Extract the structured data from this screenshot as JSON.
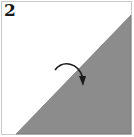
{
  "step": {
    "number": "2"
  },
  "diagram": {
    "type": "origami-fold-step",
    "shape": "square folded diagonally into triangle",
    "fold_direction": "valley fold, top-left half over to bottom-right",
    "colors": {
      "paper_white": "#ffffff",
      "paper_colored": "#8c8c8c",
      "border": "#c8c8c8",
      "outline": "#555555",
      "arrow": "#1a1a1a"
    },
    "icons": {
      "arrow": "curved-fold-arrow"
    }
  }
}
